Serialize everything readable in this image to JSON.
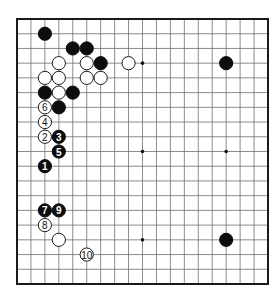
{
  "diagram": {
    "type": "go-board-diagram",
    "board_size": 19,
    "colors": {
      "black": "#0d0d0d",
      "white": "#ffffff",
      "grid": "#6e6e6e",
      "border": "#1a1a1a"
    },
    "star_points": [
      [
        3,
        3
      ],
      [
        9,
        3
      ],
      [
        15,
        3
      ],
      [
        3,
        9
      ],
      [
        9,
        9
      ],
      [
        15,
        9
      ],
      [
        3,
        15
      ],
      [
        9,
        15
      ],
      [
        15,
        15
      ]
    ],
    "stones": [
      {
        "color": "black",
        "col": 2,
        "row": 1,
        "label": ""
      },
      {
        "color": "black",
        "col": 4,
        "row": 2,
        "label": ""
      },
      {
        "color": "black",
        "col": 5,
        "row": 2,
        "label": ""
      },
      {
        "color": "black",
        "col": 6,
        "row": 3,
        "label": ""
      },
      {
        "color": "black",
        "col": 2,
        "row": 5,
        "label": ""
      },
      {
        "color": "black",
        "col": 4,
        "row": 5,
        "label": ""
      },
      {
        "color": "black",
        "col": 3,
        "row": 6,
        "label": ""
      },
      {
        "color": "black",
        "col": 15,
        "row": 3,
        "label": ""
      },
      {
        "color": "black",
        "col": 15,
        "row": 15,
        "label": ""
      },
      {
        "color": "white",
        "col": 3,
        "row": 3,
        "label": ""
      },
      {
        "color": "white",
        "col": 5,
        "row": 3,
        "label": ""
      },
      {
        "color": "white",
        "col": 8,
        "row": 3,
        "label": ""
      },
      {
        "color": "white",
        "col": 2,
        "row": 4,
        "label": ""
      },
      {
        "color": "white",
        "col": 3,
        "row": 4,
        "label": ""
      },
      {
        "color": "white",
        "col": 5,
        "row": 4,
        "label": ""
      },
      {
        "color": "white",
        "col": 6,
        "row": 4,
        "label": ""
      },
      {
        "color": "white",
        "col": 3,
        "row": 5,
        "label": ""
      },
      {
        "color": "white",
        "col": 3,
        "row": 15,
        "label": ""
      },
      {
        "color": "black",
        "col": 2,
        "row": 10,
        "label": "1"
      },
      {
        "color": "white",
        "col": 2,
        "row": 8,
        "label": "2"
      },
      {
        "color": "black",
        "col": 3,
        "row": 8,
        "label": "3"
      },
      {
        "color": "white",
        "col": 2,
        "row": 7,
        "label": "4"
      },
      {
        "color": "black",
        "col": 3,
        "row": 9,
        "label": "5"
      },
      {
        "color": "white",
        "col": 2,
        "row": 6,
        "label": "6"
      },
      {
        "color": "black",
        "col": 2,
        "row": 13,
        "label": "7"
      },
      {
        "color": "white",
        "col": 2,
        "row": 14,
        "label": "8"
      },
      {
        "color": "black",
        "col": 3,
        "row": 13,
        "label": "9"
      },
      {
        "color": "white",
        "col": 5,
        "row": 16,
        "label": "10"
      }
    ]
  }
}
